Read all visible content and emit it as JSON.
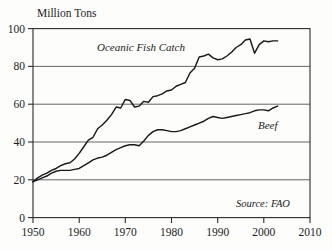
{
  "chart_data": {
    "type": "line",
    "title": "",
    "ylabel": "Million Tons",
    "xlabel": "",
    "xlim": [
      1950,
      2010
    ],
    "ylim": [
      0,
      100
    ],
    "grid": true,
    "gridlines_y": [
      20,
      40,
      60,
      80
    ],
    "yticks": [
      0,
      20,
      40,
      60,
      80,
      100
    ],
    "ytick_labels": [
      "0",
      "20",
      "40",
      "60",
      "80",
      "100"
    ],
    "xticks": [
      1950,
      1960,
      1970,
      1980,
      1990,
      2000,
      2010
    ],
    "xtick_labels": [
      "1950",
      "1960",
      "1970",
      "1980",
      "1990",
      "2000",
      "2010"
    ],
    "legend_position": "inline-annotations",
    "annotations": [
      {
        "text": "Oceanic Fish Catch",
        "x": 1964,
        "y": 76,
        "style": "italic"
      },
      {
        "text": "Beef",
        "x": 1998,
        "y": 49,
        "style": "italic"
      },
      {
        "text": "Source: FAO",
        "x": 2001,
        "y": 8,
        "style": "italic"
      }
    ],
    "series": [
      {
        "name": "Oceanic Fish Catch",
        "color": "#1a1a1a",
        "x": [
          1950,
          1951,
          1952,
          1953,
          1954,
          1955,
          1956,
          1957,
          1958,
          1959,
          1960,
          1961,
          1962,
          1963,
          1964,
          1965,
          1966,
          1967,
          1968,
          1969,
          1970,
          1971,
          1972,
          1973,
          1974,
          1975,
          1976,
          1977,
          1978,
          1979,
          1980,
          1981,
          1982,
          1983,
          1984,
          1985,
          1986,
          1987,
          1988,
          1989,
          1990,
          1991,
          1992,
          1993,
          1994,
          1995,
          1996,
          1997,
          1998,
          1999,
          2000,
          2001,
          2002,
          2003
        ],
        "values": [
          19,
          21,
          22.5,
          23.5,
          25,
          26,
          27.5,
          28.5,
          29,
          31,
          34,
          37.5,
          41,
          42.5,
          47,
          49,
          51.5,
          54.5,
          58.5,
          58,
          62.5,
          62,
          58.5,
          59,
          61.5,
          61,
          64,
          64.5,
          65.5,
          67,
          67.5,
          69.5,
          70.5,
          71.5,
          76.5,
          79,
          85,
          85.5,
          86.5,
          84.5,
          83.5,
          84,
          85.5,
          87.5,
          90,
          91.5,
          94,
          94.5,
          87,
          91.5,
          93.5,
          93,
          93.5,
          93.5
        ]
      },
      {
        "name": "Beef",
        "color": "#1a1a1a",
        "x": [
          1950,
          1951,
          1952,
          1953,
          1954,
          1955,
          1956,
          1957,
          1958,
          1959,
          1960,
          1961,
          1962,
          1963,
          1964,
          1965,
          1966,
          1967,
          1968,
          1969,
          1970,
          1971,
          1972,
          1973,
          1974,
          1975,
          1976,
          1977,
          1978,
          1979,
          1980,
          1981,
          1982,
          1983,
          1984,
          1985,
          1986,
          1987,
          1988,
          1989,
          1990,
          1991,
          1992,
          1993,
          1994,
          1995,
          1996,
          1997,
          1998,
          1999,
          2000,
          2001,
          2002,
          2003
        ],
        "values": [
          19,
          20,
          21,
          22,
          23.5,
          24.5,
          25,
          25,
          25,
          25.5,
          26,
          27.5,
          29,
          30.5,
          31.5,
          32,
          33,
          34.5,
          36,
          37,
          38,
          38.5,
          38.5,
          38,
          40.5,
          43.5,
          45.5,
          46.5,
          46.5,
          46,
          45.5,
          45.5,
          46,
          47,
          48,
          49,
          50,
          51,
          52.5,
          53.5,
          53,
          52.5,
          53,
          53.5,
          54,
          54.5,
          55,
          55.5,
          56.5,
          57,
          57,
          56.5,
          58,
          59
        ]
      }
    ]
  }
}
